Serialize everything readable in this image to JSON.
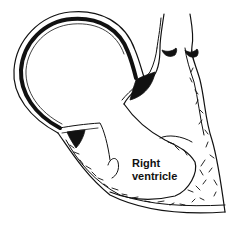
{
  "figure": {
    "type": "anatomical-line-drawing",
    "labels": [
      {
        "id": "right-ventricle",
        "line1": "Right",
        "line2": "ventricle"
      }
    ],
    "colors": {
      "ink": "#111111",
      "background": "#ffffff"
    }
  }
}
